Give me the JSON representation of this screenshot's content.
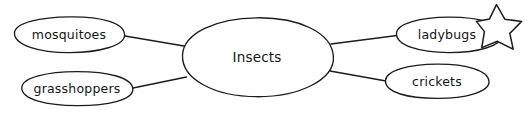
{
  "diagram": {
    "type": "concept-map",
    "background_color": "#ffffff",
    "stroke_color": "#1c1c1c",
    "text_color": "#141414",
    "center": {
      "id": "insects",
      "label": "Insects",
      "cx": 257,
      "cy": 57,
      "rx": 76,
      "ry": 40
    },
    "branches": [
      {
        "id": "mosquitoes",
        "label": "mosquitoes",
        "cx": 69,
        "cy": 34.5,
        "rx": 56,
        "ry": 18,
        "position": "top-left"
      },
      {
        "id": "grasshoppers",
        "label": "grasshoppers",
        "cx": 77,
        "cy": 88.5,
        "rx": 56,
        "ry": 17,
        "position": "bottom-left"
      },
      {
        "id": "ladybugs",
        "label": "ladybugs",
        "cx": 449,
        "cy": 34.5,
        "rx": 53,
        "ry": 18,
        "position": "top-right"
      },
      {
        "id": "crickets",
        "label": "crickets",
        "cx": 437,
        "cy": 81,
        "rx": 52,
        "ry": 17,
        "position": "bottom-right"
      }
    ],
    "connectors": [
      {
        "id": "center-to-mosquitoes",
        "from": "insects",
        "to": "mosquitoes",
        "x1": 125,
        "y1": 36,
        "x2": 187,
        "y2": 46
      },
      {
        "id": "center-to-grasshoppers",
        "from": "insects",
        "to": "grasshoppers",
        "x1": 133,
        "y1": 88,
        "x2": 186,
        "y2": 77
      },
      {
        "id": "center-to-ladybugs",
        "from": "insects",
        "to": "ladybugs",
        "x1": 331,
        "y1": 44,
        "x2": 397,
        "y2": 35
      },
      {
        "id": "center-to-crickets",
        "from": "insects",
        "to": "crickets",
        "x1": 330,
        "y1": 71,
        "x2": 386,
        "y2": 81
      }
    ],
    "annotations": [
      {
        "id": "star-marker",
        "name": "star",
        "shape": "5-point-star",
        "cx": 499,
        "cy": 26,
        "outer_radius": 23,
        "inner_radius": 9.5,
        "rotation_deg": -8,
        "attached_to": "ladybugs"
      }
    ]
  }
}
